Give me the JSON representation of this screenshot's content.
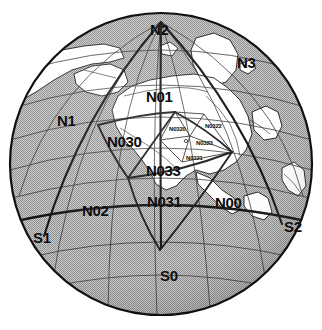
{
  "figure": {
    "type": "orthographic-globe-qtm-grid",
    "background_color": "#ffffff",
    "ocean_color": "#b4b4b4",
    "land_color": "#ffffff",
    "grid_color": "#1a1a1a",
    "coastline_color": "#141414",
    "graticule_color": "#2b2b2b",
    "globe": {
      "center_x": 161,
      "center_y": 164,
      "radius": 152
    }
  },
  "labels": {
    "major": [
      {
        "id": "N2",
        "text": "N2",
        "x": 150,
        "y": 22
      },
      {
        "id": "N3",
        "text": "N3",
        "x": 237,
        "y": 55
      },
      {
        "id": "N01",
        "text": "N01",
        "x": 146,
        "y": 89
      },
      {
        "id": "N1",
        "text": "N1",
        "x": 57,
        "y": 113
      },
      {
        "id": "N030",
        "text": "N030",
        "x": 107,
        "y": 134
      },
      {
        "id": "N033",
        "text": "N033",
        "x": 146,
        "y": 163
      },
      {
        "id": "N02",
        "text": "N02",
        "x": 82,
        "y": 203
      },
      {
        "id": "N031",
        "text": "N031",
        "x": 147,
        "y": 194
      },
      {
        "id": "N00",
        "text": "N00",
        "x": 215,
        "y": 195
      },
      {
        "id": "S1",
        "text": "S1",
        "x": 33,
        "y": 230
      },
      {
        "id": "S2",
        "text": "S2",
        "x": 284,
        "y": 219
      },
      {
        "id": "S0",
        "text": "S0",
        "x": 160,
        "y": 268
      }
    ],
    "minor": [
      {
        "id": "N0320",
        "text": "N0320",
        "x": 169,
        "y": 126
      },
      {
        "id": "N0322",
        "text": "N0322",
        "x": 205,
        "y": 123
      },
      {
        "id": "N0323",
        "text": "N0323",
        "x": 196,
        "y": 140
      },
      {
        "id": "N0321",
        "text": "N0321",
        "x": 186,
        "y": 155
      }
    ]
  }
}
